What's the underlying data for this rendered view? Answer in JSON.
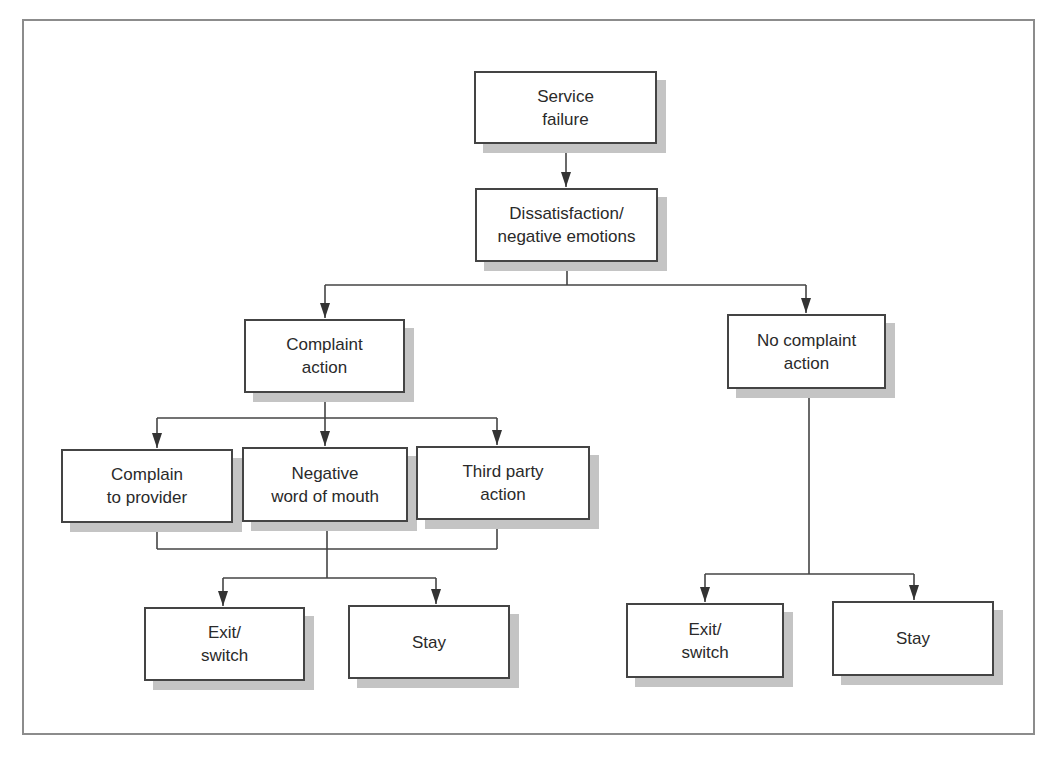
{
  "diagram": {
    "type": "flowchart",
    "nodes": [
      {
        "id": "service_failure",
        "label": "Service\nfailure"
      },
      {
        "id": "dissatisfaction",
        "label": "Dissatisfaction/\nnegative emotions"
      },
      {
        "id": "complaint_action",
        "label": "Complaint\naction"
      },
      {
        "id": "no_complaint_action",
        "label": "No complaint\naction"
      },
      {
        "id": "complain_to_provider",
        "label": "Complain\nto provider"
      },
      {
        "id": "negative_wom",
        "label": "Negative\nword of mouth"
      },
      {
        "id": "third_party_action",
        "label": "Third party\naction"
      },
      {
        "id": "exit_switch_left",
        "label": "Exit/\nswitch"
      },
      {
        "id": "stay_left",
        "label": "Stay"
      },
      {
        "id": "exit_switch_right",
        "label": "Exit/\nswitch"
      },
      {
        "id": "stay_right",
        "label": "Stay"
      }
    ],
    "edges": [
      {
        "from": "service_failure",
        "to": "dissatisfaction"
      },
      {
        "from": "dissatisfaction",
        "to": "complaint_action"
      },
      {
        "from": "dissatisfaction",
        "to": "no_complaint_action"
      },
      {
        "from": "complaint_action",
        "to": "complain_to_provider"
      },
      {
        "from": "complaint_action",
        "to": "negative_wom"
      },
      {
        "from": "complaint_action",
        "to": "third_party_action"
      },
      {
        "from": [
          "complain_to_provider",
          "negative_wom",
          "third_party_action"
        ],
        "to": "exit_switch_left"
      },
      {
        "from": [
          "complain_to_provider",
          "negative_wom",
          "third_party_action"
        ],
        "to": "stay_left"
      },
      {
        "from": "no_complaint_action",
        "to": "exit_switch_right"
      },
      {
        "from": "no_complaint_action",
        "to": "stay_right"
      }
    ]
  }
}
